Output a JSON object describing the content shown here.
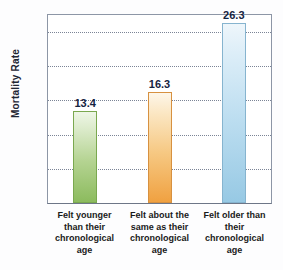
{
  "chart_data": {
    "type": "bar",
    "title": "",
    "subtitle": "",
    "xlabel": "",
    "ylabel": "Mortality Rate",
    "categories": [
      "Felt younger than their chronological age",
      "Felt about the same as their chronological age",
      "Felt older than their chronological age"
    ],
    "values": [
      13.4,
      16.3,
      26.3
    ],
    "data_labels": [
      "13.4",
      "16.3",
      "26.3"
    ],
    "ylim": [
      0,
      27.5
    ],
    "yticks": [
      0,
      5,
      10,
      15,
      20,
      25
    ],
    "ytick_labels": [
      "0",
      "5",
      "10",
      "15",
      "20",
      "25"
    ],
    "grid": "horizontal-dotted",
    "legend": "none",
    "bar_colors": [
      "#8cbb5e",
      "#f0a141",
      "#97c9e4"
    ],
    "label_color": "#15233f",
    "axis_color": "#17315e"
  },
  "axis": {
    "y_title": "Mortality Rate",
    "ticks": [
      {
        "value": 25,
        "label": "25"
      },
      {
        "value": 20,
        "label": "20"
      },
      {
        "value": 15,
        "label": "15"
      },
      {
        "value": 10,
        "label": "10"
      },
      {
        "value": 5,
        "label": "5"
      },
      {
        "value": 0,
        "label": "0"
      }
    ]
  },
  "bars": [
    {
      "label": "13.4",
      "category_line1": "Felt younger",
      "category_line2": "than their",
      "category_line3": "chronological",
      "category_line4": "age"
    },
    {
      "label": "16.3",
      "category_line1": "Felt about the",
      "category_line2": "same as their",
      "category_line3": "chronological",
      "category_line4": "age"
    },
    {
      "label": "26.3",
      "category_line1": "Felt older than",
      "category_line2": "their",
      "category_line3": "chronological",
      "category_line4": "age"
    }
  ],
  "categories_display": [
    "Felt younger\nthan their\nchronological\nage",
    "Felt about the\nsame as their\nchronological\nage",
    "Felt older than\ntheir\nchronological\nage"
  ]
}
